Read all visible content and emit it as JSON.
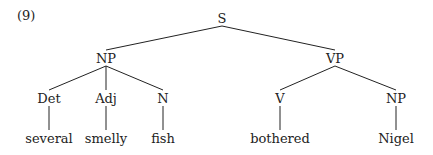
{
  "example_number": "(9)",
  "tree": {
    "nodes": [
      {
        "id": "S",
        "label": "S",
        "x": 222,
        "y": 18
      },
      {
        "id": "NP1",
        "label": "NP",
        "x": 106,
        "y": 58
      },
      {
        "id": "VP",
        "label": "VP",
        "x": 335,
        "y": 58
      },
      {
        "id": "Det",
        "label": "Det",
        "x": 49,
        "y": 98
      },
      {
        "id": "Adj",
        "label": "Adj",
        "x": 106,
        "y": 98
      },
      {
        "id": "N",
        "label": "N",
        "x": 163,
        "y": 98
      },
      {
        "id": "V",
        "label": "V",
        "x": 280,
        "y": 98
      },
      {
        "id": "NP2",
        "label": "NP",
        "x": 396,
        "y": 98
      },
      {
        "id": "w1",
        "label": "several",
        "x": 49,
        "y": 138
      },
      {
        "id": "w2",
        "label": "smelly",
        "x": 106,
        "y": 138
      },
      {
        "id": "w3",
        "label": "fish",
        "x": 163,
        "y": 138
      },
      {
        "id": "w4",
        "label": "bothered",
        "x": 280,
        "y": 138
      },
      {
        "id": "w5",
        "label": "Nigel",
        "x": 396,
        "y": 138
      }
    ],
    "edges": [
      [
        "S",
        "NP1"
      ],
      [
        "S",
        "VP"
      ],
      [
        "NP1",
        "Det"
      ],
      [
        "NP1",
        "Adj"
      ],
      [
        "NP1",
        "N"
      ],
      [
        "VP",
        "V"
      ],
      [
        "VP",
        "NP2"
      ],
      [
        "Det",
        "w1"
      ],
      [
        "Adj",
        "w2"
      ],
      [
        "N",
        "w3"
      ],
      [
        "V",
        "w4"
      ],
      [
        "NP2",
        "w5"
      ]
    ]
  }
}
